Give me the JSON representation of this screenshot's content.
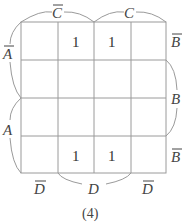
{
  "diagram": {
    "type": "karnaugh-map",
    "caption": "(4)",
    "top_labels": [
      {
        "text": "C",
        "overline": true
      },
      {
        "text": "C",
        "overline": false
      }
    ],
    "left_labels": [
      {
        "text": "A",
        "overline": true
      },
      {
        "text": "A",
        "overline": false
      }
    ],
    "right_labels": [
      {
        "text": "B",
        "overline": true
      },
      {
        "text": "B",
        "overline": false
      },
      {
        "text": "B",
        "overline": true
      }
    ],
    "bottom_labels": [
      {
        "text": "D",
        "overline": true
      },
      {
        "text": "D",
        "overline": false
      },
      {
        "text": "D",
        "overline": true
      }
    ],
    "cells": [
      [
        "",
        "1",
        "1",
        ""
      ],
      [
        "",
        "",
        "",
        ""
      ],
      [
        "",
        "",
        "",
        ""
      ],
      [
        "",
        "1",
        "1",
        ""
      ]
    ],
    "line_color": "#999999"
  }
}
